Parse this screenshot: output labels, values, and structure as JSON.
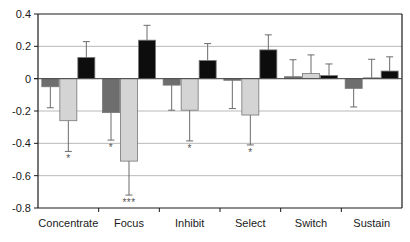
{
  "chart_data": {
    "type": "bar",
    "title": "",
    "xlabel": "",
    "ylabel": "",
    "ylim": [
      -0.8,
      0.4
    ],
    "yticks": [
      0.4,
      0.2,
      0,
      -0.2,
      -0.4,
      -0.6,
      -0.8
    ],
    "ytick_labels": [
      "0.4",
      "0.2",
      "0",
      "-0.2",
      "-0.4",
      "-0.6",
      "-0.8"
    ],
    "grid": true,
    "legend": "none",
    "categories": [
      "Concentrate",
      "Focus",
      "Inhibit",
      "Select",
      "Switch",
      "Sustain"
    ],
    "series": [
      {
        "name": "series-1-dark-gray",
        "color": "#6e6e6e",
        "values": [
          -0.05,
          -0.21,
          -0.04,
          -0.01,
          0.012,
          -0.06
        ],
        "errors": [
          0.13,
          0.17,
          0.155,
          0.175,
          0.105,
          0.115
        ],
        "significance": [
          "",
          "*",
          "",
          "",
          "",
          ""
        ]
      },
      {
        "name": "series-2-light-gray",
        "color": "#d4d4d4",
        "values": [
          -0.26,
          -0.51,
          -0.195,
          -0.225,
          0.032,
          0.005
        ],
        "errors": [
          0.19,
          0.21,
          0.19,
          0.185,
          0.115,
          0.115
        ],
        "significance": [
          "*",
          "***",
          "*",
          "*",
          "",
          ""
        ]
      },
      {
        "name": "series-3-black",
        "color": "#0d0d0d",
        "values": [
          0.131,
          0.238,
          0.112,
          0.178,
          0.019,
          0.047
        ],
        "errors": [
          0.098,
          0.092,
          0.105,
          0.093,
          0.072,
          0.088
        ],
        "significance": [
          "",
          "",
          "",
          "",
          "",
          ""
        ]
      }
    ]
  }
}
